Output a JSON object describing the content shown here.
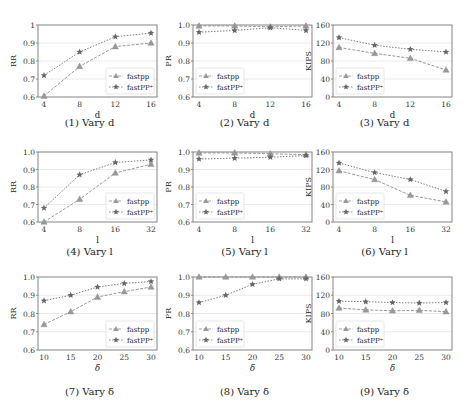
{
  "legend": {
    "series_a": "fastpp",
    "series_b": "fastPP⁺"
  },
  "colors": {
    "series_a": "#8c8c8c",
    "series_b": "#6e6e6e",
    "grid": "#e4e4e4",
    "axis": "#777777"
  },
  "chart_data": [
    {
      "id": 1,
      "type": "line",
      "caption": "(1) Vary d",
      "xlabel": "d",
      "ylabel": "RR",
      "categories": [
        "4",
        "8",
        "12",
        "16"
      ],
      "ylim": [
        0.6,
        1.0
      ],
      "yticks": [
        "0.6",
        "0.7",
        "0.8",
        "0.9",
        "1"
      ],
      "series": [
        {
          "name": "fastpp",
          "marker": "triangle",
          "values": [
            0.605,
            0.77,
            0.88,
            0.9
          ]
        },
        {
          "name": "fastPP⁺",
          "marker": "star",
          "values": [
            0.72,
            0.85,
            0.935,
            0.955
          ]
        }
      ],
      "legend_position": "lower right",
      "grid": true
    },
    {
      "id": 2,
      "type": "line",
      "caption": "(2) Vary d",
      "xlabel": "d",
      "ylabel": "PR",
      "categories": [
        "4",
        "8",
        "12",
        "16"
      ],
      "ylim": [
        0.6,
        1.0
      ],
      "yticks": [
        "0.6",
        "0.7",
        "0.8",
        "0.9",
        "1.0"
      ],
      "series": [
        {
          "name": "fastpp",
          "marker": "triangle",
          "values": [
            0.995,
            0.995,
            0.99,
            0.995
          ]
        },
        {
          "name": "fastPP⁺",
          "marker": "star",
          "values": [
            0.96,
            0.97,
            0.985,
            0.97
          ]
        }
      ],
      "legend_position": "lower left",
      "grid": true
    },
    {
      "id": 3,
      "type": "line",
      "caption": "(3) Vary d",
      "xlabel": "d",
      "ylabel": "KIPS",
      "categories": [
        "4",
        "8",
        "12",
        "16"
      ],
      "ylim": [
        0,
        160
      ],
      "yticks": [
        "0",
        "40",
        "80",
        "120",
        "160"
      ],
      "series": [
        {
          "name": "fastpp",
          "marker": "triangle",
          "values": [
            110,
            97,
            86,
            60
          ]
        },
        {
          "name": "fastPP⁺",
          "marker": "star",
          "values": [
            132,
            115,
            106,
            100
          ]
        }
      ],
      "legend_position": "lower left",
      "grid": true
    },
    {
      "id": 4,
      "type": "line",
      "caption": "(4) Vary l",
      "xlabel": "l",
      "ylabel": "RR",
      "categories": [
        "4",
        "8",
        "16",
        "32"
      ],
      "ylim": [
        0.6,
        1.0
      ],
      "yticks": [
        "0.6",
        "0.7",
        "0.8",
        "0.9",
        "1.0"
      ],
      "series": [
        {
          "name": "fastpp",
          "marker": "triangle",
          "values": [
            0.6,
            0.73,
            0.88,
            0.93
          ]
        },
        {
          "name": "fastPP⁺",
          "marker": "star",
          "values": [
            0.68,
            0.87,
            0.94,
            0.955
          ]
        }
      ],
      "legend_position": "lower right",
      "grid": true
    },
    {
      "id": 5,
      "type": "line",
      "caption": "(5) Vary l",
      "xlabel": "l",
      "ylabel": "PR",
      "categories": [
        "4",
        "8",
        "16",
        "32"
      ],
      "ylim": [
        0.6,
        1.0
      ],
      "yticks": [
        "0.6",
        "0.7",
        "0.8",
        "0.9",
        "1.0"
      ],
      "series": [
        {
          "name": "fastpp",
          "marker": "triangle",
          "values": [
            0.995,
            0.995,
            0.99,
            0.985
          ]
        },
        {
          "name": "fastPP⁺",
          "marker": "star",
          "values": [
            0.96,
            0.965,
            0.97,
            0.98
          ]
        }
      ],
      "legend_position": "lower left",
      "grid": true
    },
    {
      "id": 6,
      "type": "line",
      "caption": "(6) Vary l",
      "xlabel": "l",
      "ylabel": "KIPS",
      "categories": [
        "4",
        "8",
        "16",
        "32"
      ],
      "ylim": [
        0,
        160
      ],
      "yticks": [
        "0",
        "40",
        "80",
        "120",
        "160"
      ],
      "series": [
        {
          "name": "fastpp",
          "marker": "triangle",
          "values": [
            117,
            97,
            61,
            46
          ]
        },
        {
          "name": "fastPP⁺",
          "marker": "star",
          "values": [
            135,
            113,
            97,
            70
          ]
        }
      ],
      "legend_position": "lower left",
      "grid": true
    },
    {
      "id": 7,
      "type": "line",
      "caption": "(7) Vary δ",
      "xlabel": "δ",
      "ylabel": "RR",
      "categories": [
        "10",
        "15",
        "20",
        "25",
        "30"
      ],
      "ylim": [
        0.6,
        1.0
      ],
      "yticks": [
        "0.6",
        "0.7",
        "0.8",
        "0.9",
        "1.0"
      ],
      "series": [
        {
          "name": "fastpp",
          "marker": "triangle",
          "values": [
            0.74,
            0.81,
            0.89,
            0.92,
            0.945
          ]
        },
        {
          "name": "fastPP⁺",
          "marker": "star",
          "values": [
            0.87,
            0.9,
            0.945,
            0.965,
            0.975
          ]
        }
      ],
      "legend_position": "lower right",
      "grid": true
    },
    {
      "id": 8,
      "type": "line",
      "caption": "(8) Vary δ",
      "xlabel": "δ",
      "ylabel": "PR",
      "categories": [
        "10",
        "15",
        "20",
        "25",
        "30"
      ],
      "ylim": [
        0.6,
        1.0
      ],
      "yticks": [
        "0.6",
        "0.7",
        "0.8",
        "0.9",
        "1.0"
      ],
      "series": [
        {
          "name": "fastpp",
          "marker": "triangle",
          "values": [
            1.0,
            1.0,
            1.0,
            1.0,
            1.0
          ]
        },
        {
          "name": "fastPP⁺",
          "marker": "star",
          "values": [
            0.86,
            0.9,
            0.96,
            0.99,
            0.99
          ]
        }
      ],
      "legend_position": "lower left",
      "grid": true
    },
    {
      "id": 9,
      "type": "line",
      "caption": "(9) Vary δ",
      "xlabel": "δ",
      "ylabel": "KIPS",
      "categories": [
        "10",
        "15",
        "20",
        "25",
        "30"
      ],
      "ylim": [
        0,
        160
      ],
      "yticks": [
        "0",
        "40",
        "80",
        "120",
        "160"
      ],
      "series": [
        {
          "name": "fastpp",
          "marker": "triangle",
          "values": [
            92,
            88,
            86,
            87,
            84
          ]
        },
        {
          "name": "fastPP⁺",
          "marker": "star",
          "values": [
            107,
            106,
            104,
            103,
            104
          ]
        }
      ],
      "legend_position": "lower left",
      "grid": true
    }
  ]
}
